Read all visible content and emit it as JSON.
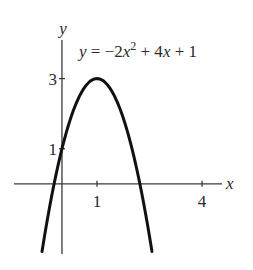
{
  "chart_data": {
    "type": "line",
    "title": "",
    "xlabel": "x",
    "ylabel": "y",
    "xlim": [
      -1.37,
      4.57
    ],
    "ylim": [
      -2.0,
      4.1
    ],
    "grid": false,
    "x_ticks": [
      {
        "value": 1,
        "label": "1"
      },
      {
        "value": 4,
        "label": "4"
      }
    ],
    "y_ticks": [
      {
        "value": 1,
        "label": "1"
      },
      {
        "value": 3,
        "label": "3"
      }
    ],
    "series": [
      {
        "name": "y = -2x^2 + 4x + 1",
        "function": {
          "a": -2,
          "b": 4,
          "c": 1
        },
        "x_range": [
          -0.57,
          2.57
        ],
        "x": [
          -0.57,
          -0.25,
          0,
          0.25,
          0.5,
          0.75,
          1,
          1.25,
          1.5,
          1.75,
          2,
          2.25,
          2.57
        ],
        "values": [
          -1.93,
          -0.125,
          1,
          1.875,
          2.5,
          2.875,
          3,
          2.875,
          2.5,
          1.875,
          1,
          -0.125,
          -1.93
        ]
      }
    ],
    "annotation": {
      "parts": [
        "y",
        " = −2",
        "x",
        "2",
        " + 4",
        "x",
        " + 1"
      ],
      "position": "top-right"
    }
  }
}
